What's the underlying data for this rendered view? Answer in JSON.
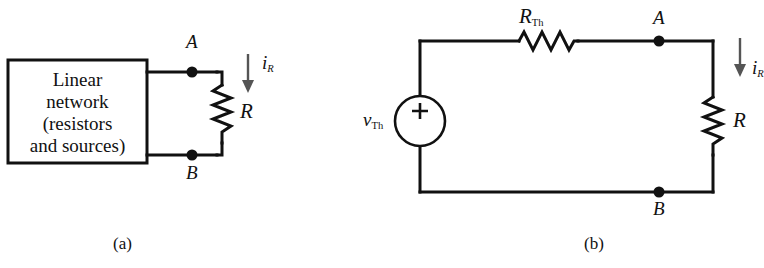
{
  "figure": {
    "stroke_color": "#111111",
    "background_color": "#ffffff",
    "width": 764,
    "height": 268
  },
  "panel_a": {
    "caption": "(a)",
    "box": {
      "name": "linear-network-box",
      "lines": [
        "Linear",
        "network",
        "(resistors",
        "and sources)"
      ]
    },
    "nodes": {
      "top_label": "A",
      "bottom_label": "B"
    },
    "resistor": {
      "label": "R",
      "orientation": "vertical",
      "zigzag_segments": 6
    },
    "current": {
      "symbol": "i",
      "subscript": "R",
      "direction": "down",
      "arrow_name": "current-arrow-down"
    }
  },
  "panel_b": {
    "caption": "(b)",
    "source": {
      "name": "voltage-source",
      "symbol": "v",
      "subscript": "Th",
      "polarity_marker": "+",
      "shape": "circle"
    },
    "series_resistor": {
      "symbol": "R",
      "subscript": "Th",
      "orientation": "horizontal",
      "zigzag_segments": 6
    },
    "load_resistor": {
      "label": "R",
      "orientation": "vertical",
      "zigzag_segments": 6
    },
    "nodes": {
      "top_label": "A",
      "bottom_label": "B"
    },
    "current": {
      "symbol": "i",
      "subscript": "R",
      "direction": "down",
      "arrow_name": "current-arrow-down"
    }
  }
}
